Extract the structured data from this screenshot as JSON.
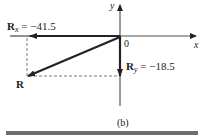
{
  "figure": {
    "caption": "(b)",
    "axes": {
      "x_label": "x",
      "y_label": "y",
      "origin_label": "0"
    },
    "vectors": {
      "rx": {
        "symbol": "R",
        "subscript": "x",
        "equals": " = ",
        "value": "−41.5",
        "numeric": -41.5
      },
      "ry": {
        "symbol": "R",
        "subscript": "y",
        "equals": " = ",
        "value": "−18.5",
        "numeric": -18.5
      },
      "r": {
        "symbol": "R"
      }
    },
    "colors": {
      "ink": "#222222",
      "dash": "#555555",
      "bar": "#6e6e6e"
    }
  }
}
